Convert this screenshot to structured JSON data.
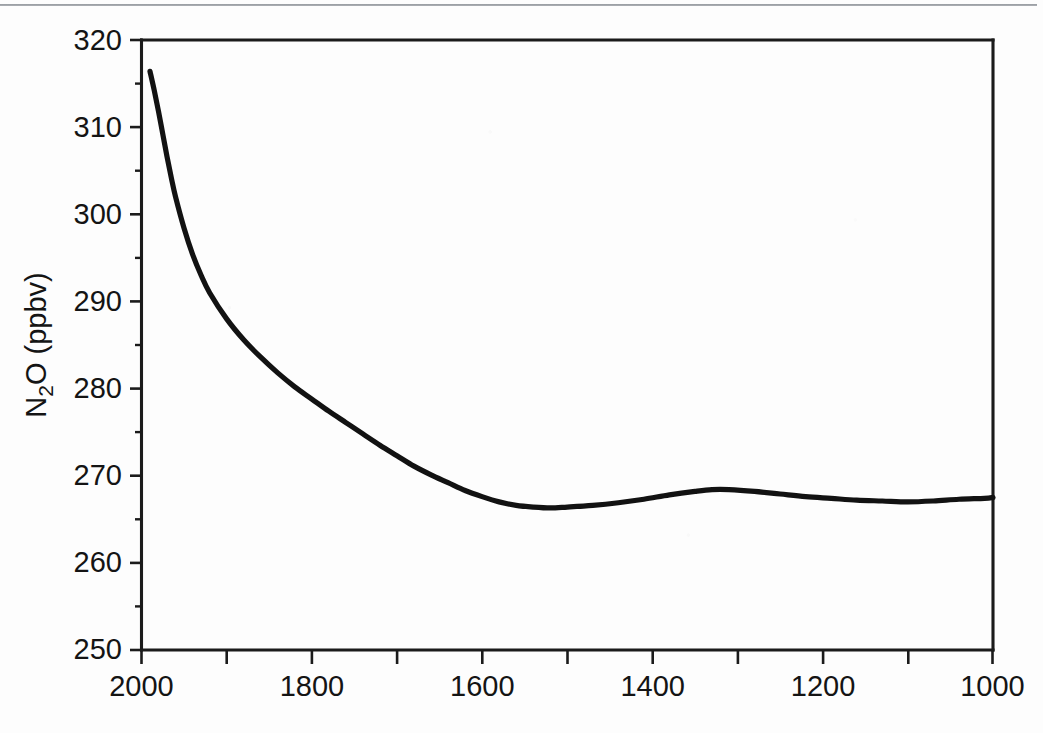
{
  "figure": {
    "background_color": "#fdfdfd",
    "ink_color": "#121212",
    "top_rule_color": "#8d9196",
    "y_axis_title_main": "N",
    "y_axis_title_sub": "2",
    "y_axis_title_rest": "O (ppbv)",
    "y_axis_title_full": "N2O (ppbv)"
  },
  "chart_data": {
    "type": "line",
    "title": "",
    "subtitle": "",
    "xlabel": "",
    "ylabel": "N2O (ppbv)",
    "xlim": [
      2000,
      1000
    ],
    "ylim": [
      250,
      320
    ],
    "x_axis_reversed": true,
    "grid": false,
    "legend": false,
    "legend_position": "none",
    "x_tick_labels": [
      "2000",
      "1800",
      "1600",
      "1400",
      "1200",
      "1000"
    ],
    "x_major_ticks": [
      2000,
      1900,
      1800,
      1700,
      1600,
      1500,
      1400,
      1300,
      1200,
      1100,
      1000
    ],
    "x_labeled_ticks": [
      2000,
      1800,
      1600,
      1400,
      1200,
      1000
    ],
    "y_tick_labels": [
      "320",
      "310",
      "300",
      "290",
      "280",
      "270",
      "260",
      "250"
    ],
    "y_major_ticks": [
      320,
      310,
      300,
      290,
      280,
      270,
      260,
      250
    ],
    "y_minor_ticks": [
      315,
      305,
      295,
      285,
      275,
      265,
      255
    ],
    "series": [
      {
        "name": "N2O",
        "x": [
          1990,
          1985,
          1980,
          1975,
          1970,
          1965,
          1960,
          1950,
          1940,
          1930,
          1920,
          1900,
          1880,
          1860,
          1840,
          1820,
          1800,
          1780,
          1760,
          1740,
          1720,
          1700,
          1680,
          1660,
          1640,
          1620,
          1600,
          1580,
          1560,
          1540,
          1520,
          1500,
          1470,
          1440,
          1410,
          1380,
          1350,
          1330,
          1310,
          1280,
          1250,
          1220,
          1190,
          1160,
          1130,
          1100,
          1070,
          1040,
          1010,
          1000
        ],
        "values": [
          316.4,
          314.2,
          311.8,
          309.2,
          306.6,
          304.2,
          302.0,
          298.4,
          295.4,
          293.0,
          291.0,
          288.0,
          285.6,
          283.6,
          281.8,
          280.2,
          278.8,
          277.4,
          276.1,
          274.8,
          273.5,
          272.3,
          271.1,
          270.1,
          269.2,
          268.3,
          267.6,
          267.0,
          266.6,
          266.4,
          266.3,
          266.4,
          266.6,
          266.9,
          267.3,
          267.8,
          268.2,
          268.4,
          268.4,
          268.2,
          267.9,
          267.6,
          267.4,
          267.2,
          267.1,
          267.0,
          267.1,
          267.3,
          267.4,
          267.5
        ]
      }
    ],
    "annotations": []
  }
}
